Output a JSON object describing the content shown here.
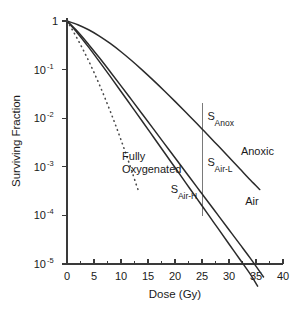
{
  "chart_data": {
    "type": "line",
    "title": "",
    "xlabel": "Dose (Gy)",
    "ylabel": "Surviving Fraction",
    "xlim": [
      0,
      40
    ],
    "ylim": [
      1e-05,
      1
    ],
    "yscale": "log",
    "grid": false,
    "legend": "inline-annotations",
    "x_ticks": [
      0,
      5,
      10,
      15,
      20,
      25,
      30,
      35,
      40
    ],
    "x_tick_labels": [
      "0",
      "5",
      "10",
      "15",
      "20",
      "25",
      "30",
      "35",
      "40"
    ],
    "x_minor_ticks": [
      2.5,
      7.5,
      12.5,
      17.5,
      22.5,
      27.5,
      32.5,
      37.5
    ],
    "y_ticks": [
      1,
      0.1,
      0.01,
      0.001,
      0.0001,
      1e-05
    ],
    "y_tick_labels": [
      {
        "mantissa": "1",
        "exponent": ""
      },
      {
        "mantissa": "10",
        "exponent": "-1"
      },
      {
        "mantissa": "10",
        "exponent": "-2"
      },
      {
        "mantissa": "10",
        "exponent": "-3"
      },
      {
        "mantissa": "10",
        "exponent": "-4"
      },
      {
        "mantissa": "10",
        "exponent": "-5"
      }
    ],
    "series": [
      {
        "name": "Anoxic",
        "style": "solid",
        "label": "Anoxic",
        "x": [
          0,
          2,
          4,
          6,
          8,
          10,
          12,
          14,
          16,
          18,
          20,
          22,
          24,
          25,
          26,
          28,
          30,
          32,
          34,
          35.7
        ],
        "y": [
          1.0,
          0.84,
          0.66,
          0.49,
          0.345,
          0.233,
          0.152,
          0.0965,
          0.0601,
          0.0368,
          0.0222,
          0.01325,
          0.00784,
          0.00601,
          0.00461,
          0.0027,
          0.00157,
          0.00091,
          0.000528,
          0.00034
        ]
      },
      {
        "name": "Air-L",
        "style": "solid",
        "label": "S_Air-L",
        "x": [
          0,
          2,
          4,
          6,
          8,
          10,
          12,
          14,
          16,
          18,
          20,
          22,
          24,
          25,
          26,
          28,
          30,
          32,
          34,
          36.4
        ],
        "y": [
          1.0,
          0.6,
          0.33,
          0.175,
          0.0905,
          0.0463,
          0.0235,
          0.0119,
          0.00602,
          0.00304,
          0.00153,
          0.000774,
          0.000391,
          0.000278,
          0.000198,
          0.0001,
          5.06e-05,
          2.56e-05,
          1.29e-05,
          5.4e-06
        ]
      },
      {
        "name": "Air-H",
        "style": "solid",
        "label": "S_Air-H",
        "x": [
          0,
          2,
          4,
          6,
          8,
          10,
          12,
          14,
          16,
          18,
          20,
          22,
          24,
          25,
          26,
          28,
          30,
          32,
          34,
          35.3
        ],
        "y": [
          1.0,
          0.555,
          0.29,
          0.146,
          0.0724,
          0.0355,
          0.0173,
          0.00844,
          0.0041,
          0.00199,
          0.000965,
          0.000468,
          0.000227,
          0.000158,
          0.00011,
          5.33e-05,
          2.58e-05,
          1.25e-05,
          6.05e-06,
          3.5e-06
        ]
      },
      {
        "name": "Fully Oxygenated",
        "style": "dotted",
        "label": "Fully Oxygenated",
        "x": [
          0,
          1,
          2,
          3,
          4,
          5,
          6,
          7,
          8,
          9,
          10,
          11,
          12,
          13,
          13.4
        ],
        "y": [
          1.0,
          0.655,
          0.415,
          0.255,
          0.152,
          0.0875,
          0.0489,
          0.0265,
          0.014,
          0.00718,
          0.00358,
          0.00174,
          0.00082,
          0.000377,
          0.0003
        ]
      }
    ],
    "reference_line": {
      "name": "dose-marker-25Gy",
      "x": 25,
      "y_top": 0.0205,
      "y_bottom": 9.6e-05
    },
    "annotations": [
      {
        "id": "s-anox",
        "base": "S",
        "sub": "Anox",
        "x": 26.0,
        "y": 0.0092
      },
      {
        "id": "anoxic",
        "base": "Anoxic",
        "sub": "",
        "x": 32.2,
        "y": 0.00175
      },
      {
        "id": "s-air-l",
        "base": "S",
        "sub": "Air-L",
        "x": 26.0,
        "y": 0.00105
      },
      {
        "id": "air",
        "base": "Air",
        "sub": "",
        "x": 33.0,
        "y": 0.000165
      },
      {
        "id": "s-air-h",
        "base": "S",
        "sub": "Air-H",
        "x": 19.2,
        "y": 0.000285
      },
      {
        "id": "fully-oxygenated-line1",
        "base": "Fully",
        "sub": "",
        "x": 10.2,
        "y": 0.00135
      },
      {
        "id": "fully-oxygenated-line2",
        "base": "Oxygenated",
        "sub": "",
        "x": 10.2,
        "y": 0.00073
      }
    ]
  },
  "colors": {
    "background": "#ffffff",
    "axis": "#3a3a3a",
    "curve": "#2b2b2b",
    "dotted_curve": "#4a4a4a",
    "reference_line": "#6b6b6b",
    "text": "#1a1a1a"
  }
}
